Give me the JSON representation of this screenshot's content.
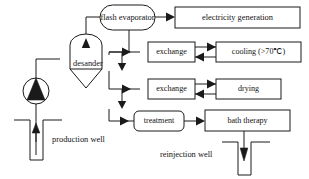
{
  "diagram": {
    "type": "process-flow",
    "background_color": "#ffffff",
    "line_color": "#1a1a1a",
    "text_color": "#121212",
    "nodes": [
      {
        "id": "flash_evaporator",
        "label": "flash evaporator",
        "shape": "stadium"
      },
      {
        "id": "electricity_generation",
        "label": "electricity generation",
        "shape": "rect"
      },
      {
        "id": "exchange_1",
        "label": "exchange",
        "shape": "rect"
      },
      {
        "id": "cooling",
        "label": "cooling (>70℃)",
        "shape": "rect"
      },
      {
        "id": "exchange_2",
        "label": "exchange",
        "shape": "rect"
      },
      {
        "id": "drying",
        "label": "drying",
        "shape": "rect"
      },
      {
        "id": "treatment",
        "label": "treatment",
        "shape": "rounded-rect"
      },
      {
        "id": "bath_therapy",
        "label": "bath therapy",
        "shape": "rect"
      },
      {
        "id": "desander",
        "label": "desander",
        "shape": "vessel-label"
      },
      {
        "id": "pump",
        "label": "",
        "shape": "circle-triangle"
      },
      {
        "id": "production_well",
        "label": "production well",
        "shape": "well-up"
      },
      {
        "id": "reinjection_well",
        "label": "reinjection well",
        "shape": "well-down"
      }
    ],
    "labels": {
      "flash_evaporator": "flash evaporator",
      "electricity_generation": "electricity generation",
      "exchange_1": "exchange",
      "cooling": "cooling (>70℃)",
      "exchange_2": "exchange",
      "drying": "drying",
      "treatment": "treatment",
      "bath_therapy": "bath therapy",
      "desander": "desander",
      "production_well": "production well",
      "reinjection_well": "reinjection well"
    }
  }
}
